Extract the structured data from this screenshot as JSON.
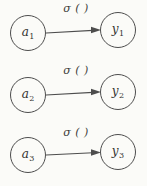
{
  "diagram": {
    "type": "node-link",
    "background_color": "#fbfbf8",
    "stroke_color": "#4d4d4d",
    "text_color": "#333330",
    "arrow_label": "σ ( )",
    "rows": [
      {
        "input_base": "a",
        "input_sub": "1",
        "output_base": "y",
        "output_sub": "1"
      },
      {
        "input_base": "a",
        "input_sub": "2",
        "output_base": "y",
        "output_sub": "2"
      },
      {
        "input_base": "a",
        "input_sub": "3",
        "output_base": "y",
        "output_sub": "3"
      }
    ]
  }
}
